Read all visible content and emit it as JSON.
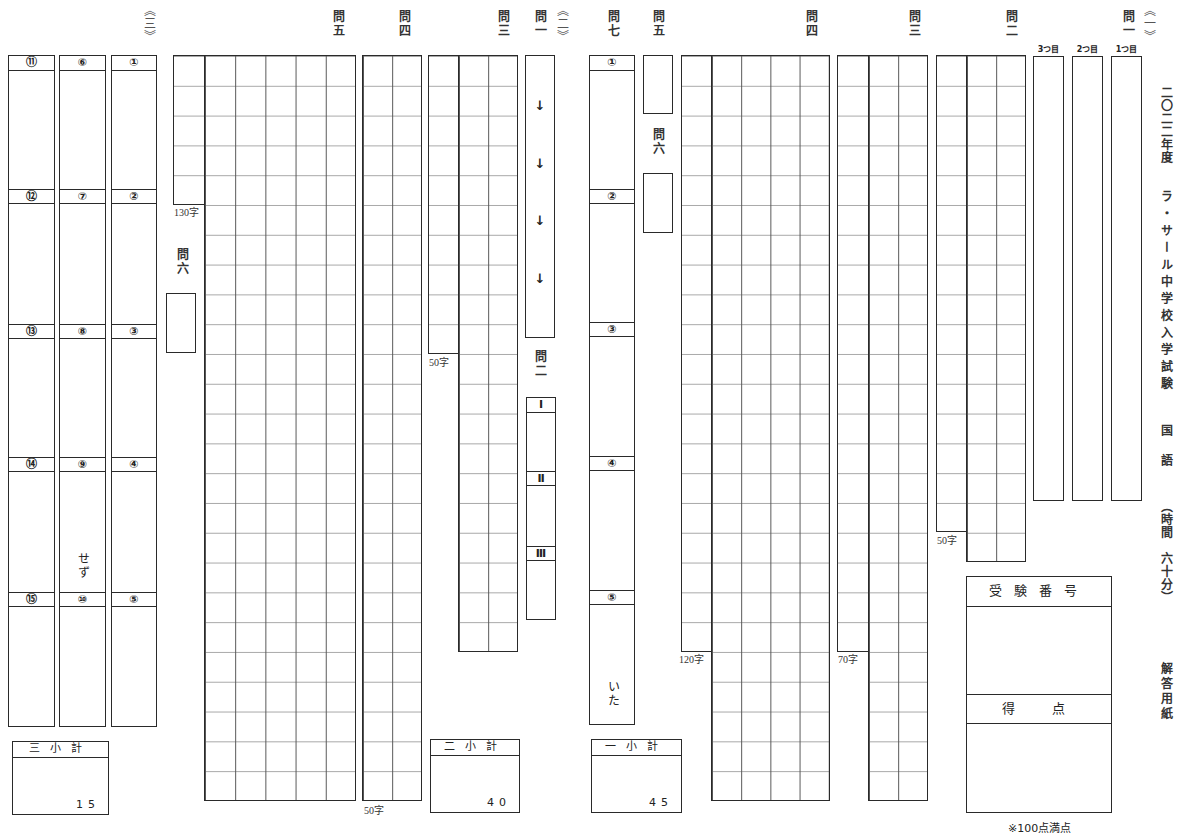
{
  "sheet": {
    "title": {
      "year": "二〇二二年度",
      "school_exam": "ラ・サール中学校入学試験",
      "subject": "国語",
      "time": "（時間　六十分）",
      "form": "解答用紙"
    },
    "exam_number_label": "受験番号",
    "score_label": "得　点",
    "full_score_note": "※100点満点"
  },
  "section1": {
    "marker": "《一》",
    "q1": {
      "label": "問一",
      "boxes": [
        "3つ目",
        "2つ目",
        "1つ目"
      ]
    },
    "q2": {
      "label": "問二",
      "limit": "50字"
    },
    "q3": {
      "label": "問三",
      "limit": "70字"
    },
    "q4": {
      "label": "問四",
      "limit": "120字"
    },
    "q5": {
      "label": "問五"
    },
    "q6": {
      "label": "問六"
    },
    "q7": {
      "label": "問七",
      "items": [
        "①",
        "②",
        "③",
        "④",
        "⑤"
      ],
      "suffix": "いた"
    },
    "subtotal": {
      "label": "一小計",
      "points": "45"
    }
  },
  "section2": {
    "marker": "《二》",
    "q1": {
      "label": "問一",
      "arrows": [
        "↓",
        "↓",
        "↓",
        "↓"
      ]
    },
    "q2": {
      "label": "問二",
      "items": [
        "Ⅰ",
        "Ⅱ",
        "Ⅲ"
      ]
    },
    "q3": {
      "label": "問三",
      "limit": "50字"
    },
    "q4": {
      "label": "問四",
      "limit": "50字"
    },
    "q5": {
      "label": "問五",
      "limit": "130字"
    },
    "q6": {
      "label": "問六"
    },
    "subtotal": {
      "label": "二小計",
      "points": "40"
    }
  },
  "section3": {
    "marker": "《三》",
    "items": [
      "①",
      "②",
      "③",
      "④",
      "⑤",
      "⑥",
      "⑦",
      "⑧",
      "⑨",
      "⑩",
      "⑪",
      "⑫",
      "⑬",
      "⑭",
      "⑮"
    ],
    "item9_suffix": "せず",
    "subtotal": {
      "label": "三小計",
      "points": "15"
    }
  }
}
